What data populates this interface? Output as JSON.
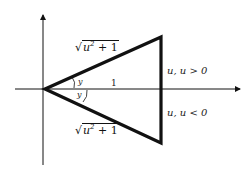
{
  "diagram": {
    "type": "geometric-triangle-on-axes",
    "labels": {
      "hyp_upper": {
        "radical": "√",
        "body": "u",
        "exp": "2",
        "rest": " + 1"
      },
      "hyp_lower": {
        "radical": "√",
        "body": "u",
        "exp": "2",
        "rest": " + 1"
      },
      "base": "1",
      "angle_upper": "y",
      "angle_lower": "y",
      "side_upper": "u, u > 0",
      "side_lower": "u, u < 0"
    },
    "colors": {
      "stroke": "#111111",
      "axis": "#111111",
      "text": "#222222"
    }
  }
}
